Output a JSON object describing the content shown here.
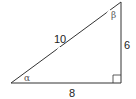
{
  "diagram": {
    "type": "right-triangle",
    "vertices": {
      "A": [
        11,
        83
      ],
      "B": [
        121,
        83
      ],
      "C": [
        121,
        2
      ]
    },
    "sides": {
      "hypotenuse": "10",
      "vertical": "6",
      "horizontal": "8"
    },
    "angles": {
      "bottom_left": "α",
      "top_right": "β"
    },
    "right_angle_marker": true,
    "stroke_color": "#333333"
  }
}
